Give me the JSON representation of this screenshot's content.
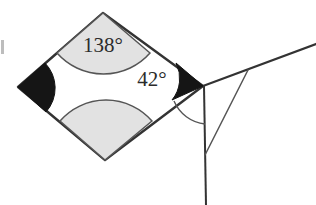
{
  "figure": {
    "type": "geometry-diagram",
    "canvas": {
      "width": 316,
      "height": 205,
      "background": "#ffffff"
    }
  },
  "colors": {
    "stroke": "#333333",
    "thin_stroke": "#555555",
    "sector_fill": "#e2e2e2",
    "sector_stroke": "#555555",
    "solid_angle_fill": "#151515",
    "label_text": "#2b2b2b",
    "artifact": "#bdbdbd"
  },
  "labels": {
    "top_angle": "138°",
    "right_angle": "42°"
  },
  "label_positions": {
    "top_angle": {
      "x": 103,
      "y": 52,
      "font_size": 21
    },
    "right_angle": {
      "x": 152,
      "y": 86,
      "font_size": 21
    }
  },
  "shape": {
    "name": "rhombus",
    "vertices": {
      "top": {
        "x": 103,
        "y": 13
      },
      "left": {
        "x": 18,
        "y": 87
      },
      "bottom": {
        "x": 105,
        "y": 160
      },
      "right": {
        "x": 203,
        "y": 86
      }
    },
    "path": "M 103,13 L 18,87 L 105,160 L 203,86 Z",
    "fill": "#ffffff"
  },
  "angle_markers": [
    {
      "id": "top-angle-sector",
      "vertex": "top",
      "style": "shaded-sector",
      "label": "138°",
      "path": "M 103,13 L 57,53 A 62,62 0 0 0 150,53 Z"
    },
    {
      "id": "bottom-angle-sector",
      "vertex": "bottom",
      "style": "shaded-sector",
      "label": "",
      "path": "M 105,160 L 60,121 A 61,61 0 0 1 152,121 Z"
    },
    {
      "id": "left-angle-solid",
      "vertex": "left",
      "style": "solid-filled",
      "label": "",
      "path": "M 18,87 L 45,63 A 36,36 0 0 1 46,112 Z"
    },
    {
      "id": "right-angle-solid",
      "vertex": "right",
      "style": "solid-filled",
      "label": "42°",
      "path": "M 203,86 L 172,100 A 34,34 0 0 0 176,63 Z"
    },
    {
      "id": "exterior-angle-arc",
      "vertex": "right",
      "style": "thin-arc",
      "label": "",
      "path": "M 174,101 A 38,38 0 0 0 205,124"
    }
  ],
  "lines": [
    {
      "id": "vertical-line",
      "from": {
        "x": 204,
        "y": 86
      },
      "to": {
        "x": 206,
        "y": 205
      },
      "weight": "medium"
    },
    {
      "id": "upper-ray",
      "from": {
        "x": 203,
        "y": 86
      },
      "to": {
        "x": 316,
        "y": 44
      },
      "weight": "medium"
    },
    {
      "id": "transversal-line",
      "from": {
        "x": 248,
        "y": 70
      },
      "to": {
        "x": 205,
        "y": 155
      },
      "weight": "thin"
    }
  ],
  "artifacts": [
    {
      "id": "left-edge-clipped-mark",
      "x": 1,
      "y": 40,
      "width": 3,
      "height": 14
    }
  ]
}
